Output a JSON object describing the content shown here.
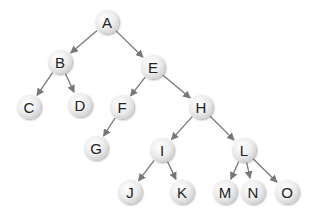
{
  "diagram": {
    "type": "tree",
    "colors": {
      "node_fill_center": "#fbfbfb",
      "node_fill_edge": "#d6d6d6",
      "edge": "#777777",
      "label": "#222222"
    },
    "node_radius": 12,
    "nodes": [
      {
        "id": "A",
        "label": "A",
        "x": 107,
        "y": 22
      },
      {
        "id": "B",
        "label": "B",
        "x": 60,
        "y": 62
      },
      {
        "id": "E",
        "label": "E",
        "x": 153,
        "y": 67
      },
      {
        "id": "C",
        "label": "C",
        "x": 29,
        "y": 107
      },
      {
        "id": "D",
        "label": "D",
        "x": 80,
        "y": 105
      },
      {
        "id": "F",
        "label": "F",
        "x": 122,
        "y": 107
      },
      {
        "id": "H",
        "label": "H",
        "x": 201,
        "y": 107
      },
      {
        "id": "G",
        "label": "G",
        "x": 96,
        "y": 148
      },
      {
        "id": "I",
        "label": "I",
        "x": 162,
        "y": 150
      },
      {
        "id": "L",
        "label": "L",
        "x": 244,
        "y": 150
      },
      {
        "id": "J",
        "label": "J",
        "x": 130,
        "y": 192
      },
      {
        "id": "K",
        "label": "K",
        "x": 182,
        "y": 192
      },
      {
        "id": "M",
        "label": "M",
        "x": 225,
        "y": 192
      },
      {
        "id": "N",
        "label": "N",
        "x": 253,
        "y": 192
      },
      {
        "id": "O",
        "label": "O",
        "x": 287,
        "y": 192
      }
    ],
    "edges": [
      [
        "A",
        "B"
      ],
      [
        "A",
        "E"
      ],
      [
        "B",
        "C"
      ],
      [
        "B",
        "D"
      ],
      [
        "E",
        "F"
      ],
      [
        "E",
        "H"
      ],
      [
        "F",
        "G"
      ],
      [
        "H",
        "I"
      ],
      [
        "H",
        "L"
      ],
      [
        "I",
        "J"
      ],
      [
        "I",
        "K"
      ],
      [
        "L",
        "M"
      ],
      [
        "L",
        "N"
      ],
      [
        "L",
        "O"
      ]
    ]
  }
}
